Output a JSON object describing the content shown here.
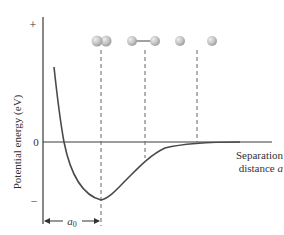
{
  "diagram": {
    "type": "potential-energy-curve",
    "y_axis": {
      "label": "Potential energy (eV)",
      "tick_plus": "+",
      "tick_zero": "0",
      "tick_minus": "–"
    },
    "x_axis": {
      "label_line1": "Separation",
      "label_line2_text": "distance ",
      "label_line2_var": "a"
    },
    "equilibrium_marker": {
      "label_var": "a",
      "label_sub": "0"
    },
    "atom_states": [
      {
        "name": "overlapping-pair",
        "description": "two atoms touching at equilibrium"
      },
      {
        "name": "bonded-pair",
        "description": "two atoms connected by bond line"
      },
      {
        "name": "separated-atom-1",
        "description": "single atom"
      },
      {
        "name": "separated-atom-2",
        "description": "single atom"
      }
    ],
    "colors": {
      "curve": "#4a4a4a",
      "axis": "#3a3a3a",
      "dashed": "#666666",
      "atom_fill": "#c4c4c4",
      "atom_highlight": "#e8e8e8"
    }
  }
}
